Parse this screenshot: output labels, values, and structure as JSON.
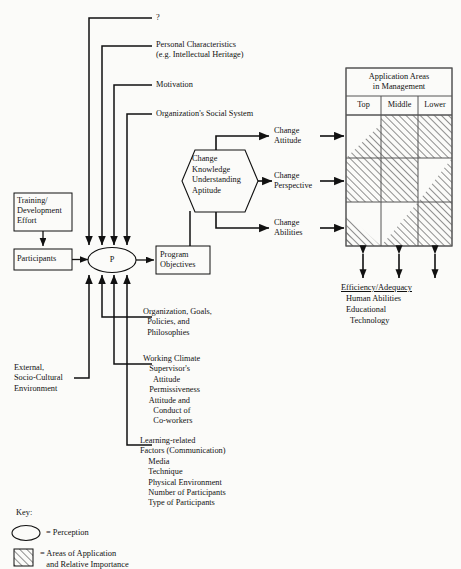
{
  "figure": {
    "type": "flow-diagram",
    "title": "",
    "perception_node": "P"
  },
  "left_boxes": [
    {
      "id": "training",
      "label": "Training/\nDevelopment\nEffort"
    },
    {
      "id": "participants",
      "label": "Participants"
    },
    {
      "id": "program_objectives",
      "label": "Program\nObjectives"
    }
  ],
  "top_inputs": [
    {
      "id": "unknown",
      "label": "?"
    },
    {
      "id": "personal_characteristics",
      "label": "Personal Characteristics\n(e.g. Intellectual Heritage)"
    },
    {
      "id": "motivation",
      "label": "Motivation"
    },
    {
      "id": "org_social_system",
      "label": "Organization's Social System"
    }
  ],
  "side_input": {
    "id": "external",
    "label": "External,\nSocio-Cultural\nEnvironment"
  },
  "bottom_inputs": [
    {
      "id": "org_goals",
      "label": "Organization, Goals,\n  Policies, and\n  Philosophies"
    },
    {
      "id": "working_climate",
      "label": "Working Climate\n   Supervisor's\n     Attitude\n   Permissiveness\n   Attitude and\n     Conduct of\n     Co-workers"
    },
    {
      "id": "learning_factors",
      "label": "Learning-related\nFactors (Communication)\n    Media\n    Technique\n    Physical Environment\n    Number of Participants\n    Type of Participants"
    }
  ],
  "hexagon": {
    "id": "change-hexagon",
    "label": "Change\nKnowledge\nUnderstanding\nAptitude"
  },
  "change_outputs": [
    {
      "id": "change_attitude",
      "label": "Change\nAttitude"
    },
    {
      "id": "change_perspective",
      "label": "Change\nPerspective"
    },
    {
      "id": "change_abilities",
      "label": "Change\nAbilities"
    }
  ],
  "matrix": {
    "title": "Application Areas\nin Management",
    "columns": [
      "Top",
      "Middle",
      "Lower"
    ],
    "rows": [
      {
        "row": 0,
        "cells": [
          "triangle-lower-left",
          "full",
          "full"
        ]
      },
      {
        "row": 1,
        "cells": [
          "full",
          "full",
          "triangle-upper-right"
        ]
      },
      {
        "row": 2,
        "cells": [
          "triangle-lower-left-small",
          "triangle-lower-right",
          "full"
        ]
      }
    ]
  },
  "matrix_footer": {
    "heading": "Efficiency/Adequacy",
    "lines": [
      "Human Abilities",
      "Educational",
      "  Technology"
    ]
  },
  "key": {
    "title": "Key:",
    "items": [
      {
        "symbol": "ellipse",
        "label": "= Perception"
      },
      {
        "symbol": "hatched-square",
        "label": "= Areas of Application\n   and Relative Importance"
      }
    ]
  },
  "colors": {
    "ink": "#111111",
    "paper": "#fbfbf9",
    "hatch": "#555555"
  }
}
